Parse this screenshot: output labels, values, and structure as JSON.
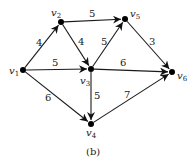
{
  "caption": "(b)",
  "nodes": [
    {
      "id": "v1",
      "name": "v",
      "sub": "1",
      "x": 23,
      "y": 70,
      "lx": 9,
      "ly": 74
    },
    {
      "id": "v2",
      "name": "v",
      "sub": "2",
      "x": 61,
      "y": 22,
      "lx": 51,
      "ly": 16
    },
    {
      "id": "v3",
      "name": "v",
      "sub": "3",
      "x": 91,
      "y": 69,
      "lx": 80,
      "ly": 84
    },
    {
      "id": "v4",
      "name": "v",
      "sub": "4",
      "x": 91,
      "y": 124,
      "lx": 86,
      "ly": 136
    },
    {
      "id": "v5",
      "name": "v",
      "sub": "5",
      "x": 125,
      "y": 19,
      "lx": 130,
      "ly": 17
    },
    {
      "id": "v6",
      "name": "v",
      "sub": "6",
      "x": 172,
      "y": 72,
      "lx": 177,
      "ly": 79
    }
  ],
  "edges": [
    {
      "from": "v1",
      "to": "v2",
      "weight": "4",
      "lx": 36,
      "ly": 46
    },
    {
      "from": "v1",
      "to": "v3",
      "weight": "5",
      "lx": 52,
      "ly": 66
    },
    {
      "from": "v1",
      "to": "v4",
      "weight": "6",
      "lx": 45,
      "ly": 101
    },
    {
      "from": "v2",
      "to": "v5",
      "weight": "5",
      "lx": 89,
      "ly": 17
    },
    {
      "from": "v2",
      "to": "v3",
      "weight": "4",
      "lx": 78,
      "ly": 45
    },
    {
      "from": "v3",
      "to": "v5",
      "weight": "5",
      "lx": 101,
      "ly": 45
    },
    {
      "from": "v3",
      "to": "v6",
      "weight": "6",
      "lx": 120,
      "ly": 66
    },
    {
      "from": "v3",
      "to": "v4",
      "weight": "5",
      "lx": 94,
      "ly": 99
    },
    {
      "from": "v5",
      "to": "v6",
      "weight": "3",
      "lx": 149,
      "ly": 45
    },
    {
      "from": "v4",
      "to": "v6",
      "weight": "7",
      "lx": 124,
      "ly": 98
    }
  ]
}
